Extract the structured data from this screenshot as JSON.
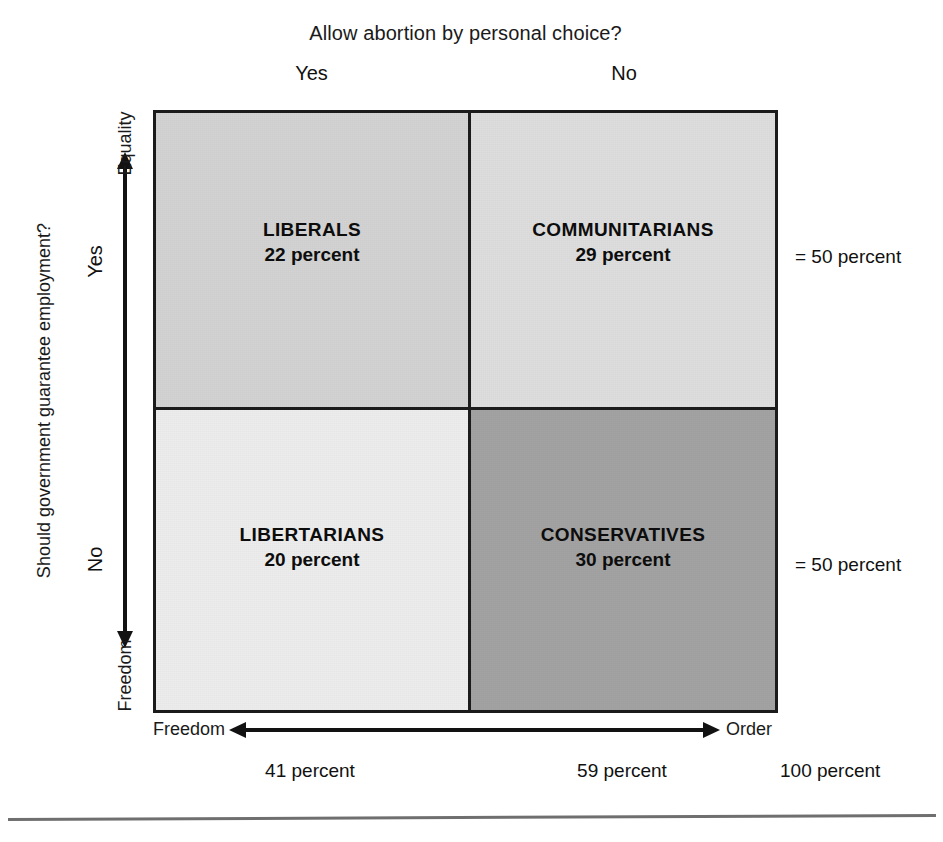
{
  "chart_data": {
    "type": "table",
    "title": "Allow abortion by personal choice?",
    "xlabel": "Freedom ↔ Order",
    "ylabel": "Should government guarantee employment?",
    "column_headers": [
      "Yes",
      "No"
    ],
    "row_headers": [
      "Yes",
      "No"
    ],
    "categories": [
      "LIBERALS",
      "COMMUNITARIANS",
      "LIBERTARIANS",
      "CONSERVATIVES"
    ],
    "values": [
      22,
      29,
      20,
      30
    ],
    "cells": [
      {
        "name": "LIBERALS",
        "percent_label": "22 percent",
        "value": 22,
        "row": "Yes",
        "column": "Yes",
        "fill": "#d3d3d3"
      },
      {
        "name": "COMMUNITARIANS",
        "percent_label": "29 percent",
        "value": 29,
        "row": "Yes",
        "column": "No",
        "fill": "#dedede"
      },
      {
        "name": "LIBERTARIANS",
        "percent_label": "20 percent",
        "value": 20,
        "row": "No",
        "column": "Yes",
        "fill": "#ededed"
      },
      {
        "name": "CONSERVATIVES",
        "percent_label": "30 percent",
        "value": 30,
        "row": "No",
        "column": "No",
        "fill": "#a3a3a3"
      }
    ],
    "row_totals": [
      50,
      50
    ],
    "column_totals": [
      41,
      59
    ],
    "grand_total": 100,
    "grid": false,
    "legend": "none"
  },
  "header": {
    "title": "Allow abortion by personal choice?",
    "col_yes": "Yes",
    "col_no": "No"
  },
  "y_axis": {
    "question": "Should government guarantee employment?",
    "tick_yes": "Yes",
    "tick_no": "No",
    "top_end": "Equality",
    "bottom_end": "Freedom"
  },
  "x_axis": {
    "left_end": "Freedom",
    "right_end": "Order"
  },
  "quadrants": {
    "top_left": {
      "name": "LIBERALS",
      "percent": "22 percent"
    },
    "top_right": {
      "name": "COMMUNITARIANS",
      "percent": "29 percent"
    },
    "bottom_left": {
      "name": "LIBERTARIANS",
      "percent": "20 percent"
    },
    "bottom_right": {
      "name": "CONSERVATIVES",
      "percent": "30 percent"
    }
  },
  "row_totals": {
    "top": "= 50 percent",
    "bottom": "= 50 percent"
  },
  "column_totals": {
    "left": "41 percent",
    "right": "59 percent",
    "grand": "100 percent"
  },
  "colors": {
    "ink": "#121212",
    "top_left_fill": "#d3d3d3",
    "top_right_fill": "#dedede",
    "bottom_left_fill": "#ededed",
    "bottom_right_fill": "#a3a3a3",
    "rule": "#6f6f6f"
  }
}
